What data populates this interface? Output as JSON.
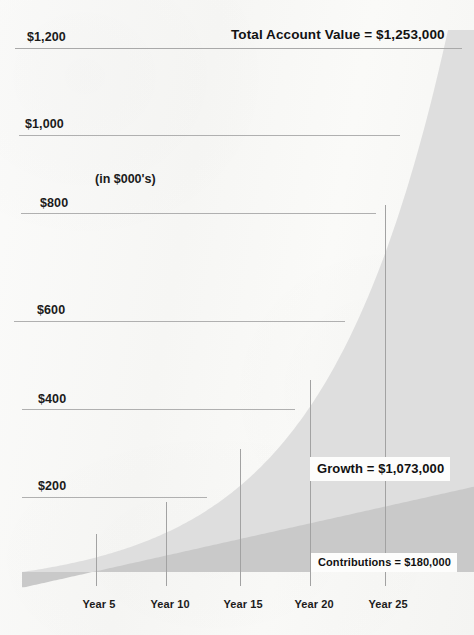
{
  "chart_data": {
    "type": "area",
    "title": "Total Account Value = $1,253,000",
    "subtitle": "(in $000's)",
    "xlabel": "",
    "ylabel": "",
    "stacked": true,
    "grid": true,
    "legend_position": "inline-callouts",
    "units_note": "(in $000's)",
    "xlim": [
      0,
      26
    ],
    "ylim": [
      0,
      1253
    ],
    "y_ticks": [
      200,
      400,
      600,
      800,
      1000,
      1200
    ],
    "y_tick_labels": [
      "$200",
      "$400",
      "$600",
      "$800",
      "$1,000",
      "$1,200"
    ],
    "x_ticks": [
      5,
      10,
      15,
      20,
      25
    ],
    "x_tick_labels": [
      "Year 5",
      "Year 10",
      "Year 15",
      "Year 20",
      "Year 25"
    ],
    "x": [
      0,
      1,
      2,
      3,
      4,
      5,
      6,
      7,
      8,
      9,
      10,
      11,
      12,
      13,
      14,
      15,
      16,
      17,
      18,
      19,
      20,
      21,
      22,
      23,
      24,
      25,
      26
    ],
    "series": [
      {
        "name": "Contributions",
        "label": "Contributions = $180,000",
        "color": "#c9c9c9",
        "total": 180000,
        "total_display": "$180,000",
        "values": [
          0,
          7.2,
          14.4,
          21.6,
          28.8,
          36,
          43.2,
          50.4,
          57.6,
          64.8,
          72,
          79.2,
          86.4,
          93.6,
          100.8,
          108,
          115.2,
          122.4,
          129.6,
          136.8,
          144,
          151.2,
          158.4,
          165.6,
          172.8,
          180,
          187.2
        ]
      },
      {
        "name": "Growth",
        "label": "Growth = $1,073,000",
        "color": "#dedede",
        "total": 1073000,
        "total_display": "$1,073,000",
        "values": [
          0,
          0.6,
          2.6,
          6.2,
          11.6,
          19.2,
          29.3,
          42.4,
          58.9,
          79.3,
          104.2,
          134.3,
          170.3,
          213.1,
          263.6,
          323.1,
          392.8,
          474.2,
          569.0,
          679.0,
          806.3,
          953.3,
          1122.7,
          1318.1,
          1543.2,
          1073.0,
          1500.0
        ]
      }
    ],
    "total_account_value": 1253000,
    "total_account_value_display": "$1,253,000",
    "annotations": [
      {
        "name": "total-account-value",
        "text": "Total Account Value = $1,253,000"
      },
      {
        "name": "growth",
        "text": "Growth = $1,073,000"
      },
      {
        "name": "contributions",
        "text": "Contributions = $180,000"
      },
      {
        "name": "units",
        "text": "(in $000's)"
      }
    ]
  },
  "colors": {
    "background": "#f8f8f6",
    "growth_area": "#dedede",
    "contributions_area": "#c9c9c9",
    "gridline": "#b4b4b4",
    "tick_line": "#a8a8a8",
    "text": "#1b1b1b",
    "callout_background": "#fdfdfc"
  }
}
